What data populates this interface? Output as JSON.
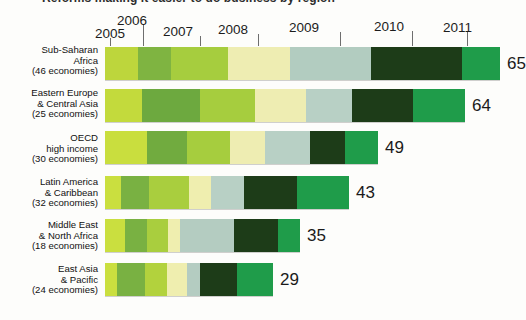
{
  "title": {
    "text": "Reforms making it easier to do business by region"
  },
  "axis": {
    "years": [
      "2005",
      "2006",
      "2007",
      "2008",
      "2009",
      "2010",
      "2011"
    ]
  },
  "chart_data": {
    "type": "bar",
    "orientation": "horizontal",
    "stacked": true,
    "title": "Reforms making it easier to do business by region",
    "xlabel": "",
    "ylabel": "",
    "grid": false,
    "legend": "none",
    "series_names": [
      "2005",
      "2006",
      "2007",
      "2008",
      "2009",
      "2010",
      "2011"
    ],
    "series_colors": [
      "#bcd63a",
      "#7fb441",
      "#a8ce3c",
      "#eeeeb0",
      "#b4cdc2",
      "#1d3d18",
      "#1f9d4a"
    ],
    "categories": [
      "Sub-Saharan Africa (46 economies)",
      "Eastern Europe & Central Asia (25 economies)",
      "OECD high income (30 economies)",
      "Latin America & Caribbean (32 economies)",
      "Middle East & North Africa (18 economies)",
      "East Asia & Pacific (24 economies)"
    ],
    "totals": [
      65,
      64,
      49,
      43,
      35,
      29
    ],
    "values": [
      [
        9,
        9,
        8,
        11,
        11,
        12,
        5
      ],
      [
        5,
        8,
        8,
        7,
        6,
        8,
        7
      ],
      [
        6,
        5,
        6,
        5,
        6,
        5,
        4
      ],
      [
        2,
        4,
        5,
        3,
        4,
        7,
        7
      ],
      [
        3,
        3,
        3,
        2,
        7,
        6,
        3
      ],
      [
        2,
        4,
        3,
        3,
        2,
        5,
        5
      ]
    ]
  },
  "rows": [
    {
      "label": "Sub-Saharan\nAfrica\n(46 economies)",
      "value": "65",
      "segments": [
        {
          "year": "2005",
          "color": "#bdd63c",
          "width": 33
        },
        {
          "year": "2006",
          "color": "#7fb441",
          "width": 33
        },
        {
          "year": "2007",
          "color": "#a6cd3e",
          "width": 57
        },
        {
          "year": "2008",
          "color": "#eeedb2",
          "width": 62
        },
        {
          "year": "2009",
          "color": "#b2ccc0",
          "width": 81
        },
        {
          "year": "2010",
          "color": "#1d3c18",
          "width": 91
        },
        {
          "year": "2011",
          "color": "#1f9c4a",
          "width": 38
        }
      ]
    },
    {
      "label": "Eastern Europe\n& Central Asia\n(25 economies)",
      "value": "64",
      "segments": [
        {
          "year": "2005",
          "color": "#c3da3c",
          "width": 37
        },
        {
          "year": "2006",
          "color": "#6da93f",
          "width": 58
        },
        {
          "year": "2007",
          "color": "#a6cd3e",
          "width": 55
        },
        {
          "year": "2008",
          "color": "#eeedb2",
          "width": 51
        },
        {
          "year": "2009",
          "color": "#b8d0c5",
          "width": 46
        },
        {
          "year": "2010",
          "color": "#1d3c18",
          "width": 61
        },
        {
          "year": "2011",
          "color": "#1f9c4a",
          "width": 52
        }
      ]
    },
    {
      "label": "OECD\nhigh income\n(30 economies)",
      "value": "49",
      "segments": [
        {
          "year": "2005",
          "color": "#c9de3e",
          "width": 42
        },
        {
          "year": "2006",
          "color": "#71ab3f",
          "width": 40
        },
        {
          "year": "2007",
          "color": "#a6cd3e",
          "width": 43
        },
        {
          "year": "2008",
          "color": "#eeedb2",
          "width": 35
        },
        {
          "year": "2009",
          "color": "#b8d0c5",
          "width": 45
        },
        {
          "year": "2010",
          "color": "#1d3c18",
          "width": 35
        },
        {
          "year": "2011",
          "color": "#1f9c4a",
          "width": 33
        }
      ]
    },
    {
      "label": "Latin America\n& Caribbean\n(32 economies)",
      "value": "43",
      "segments": [
        {
          "year": "2005",
          "color": "#cadf3f",
          "width": 16
        },
        {
          "year": "2006",
          "color": "#79b142",
          "width": 28
        },
        {
          "year": "2007",
          "color": "#a9ce3e",
          "width": 40
        },
        {
          "year": "2008",
          "color": "#efeeaf",
          "width": 22
        },
        {
          "year": "2009",
          "color": "#b8d0c5",
          "width": 33
        },
        {
          "year": "2010",
          "color": "#1d3c18",
          "width": 53
        },
        {
          "year": "2011",
          "color": "#1f9c4a",
          "width": 52
        }
      ]
    },
    {
      "label": "Middle East\n& North Africa\n(18 economies)",
      "value": "35",
      "segments": [
        {
          "year": "2005",
          "color": "#cadf3f",
          "width": 20
        },
        {
          "year": "2006",
          "color": "#79b142",
          "width": 22
        },
        {
          "year": "2007",
          "color": "#a9ce3e",
          "width": 21
        },
        {
          "year": "2008",
          "color": "#efeeaf",
          "width": 12
        },
        {
          "year": "2009",
          "color": "#b4ccc1",
          "width": 54
        },
        {
          "year": "2010",
          "color": "#1d3c18",
          "width": 44
        },
        {
          "year": "2011",
          "color": "#1f9c4a",
          "width": 22
        }
      ]
    },
    {
      "label": "East Asia\n& Pacific\n(24 economies)",
      "value": "29",
      "segments": [
        {
          "year": "2005",
          "color": "#cadf3f",
          "width": 12
        },
        {
          "year": "2006",
          "color": "#79b142",
          "width": 28
        },
        {
          "year": "2007",
          "color": "#b2d23d",
          "width": 22
        },
        {
          "year": "2008",
          "color": "#efeeaf",
          "width": 20
        },
        {
          "year": "2009",
          "color": "#b4ccc1",
          "width": 13
        },
        {
          "year": "2010",
          "color": "#1d3c18",
          "width": 37
        },
        {
          "year": "2011",
          "color": "#1f9c4a",
          "width": 36
        }
      ]
    }
  ]
}
